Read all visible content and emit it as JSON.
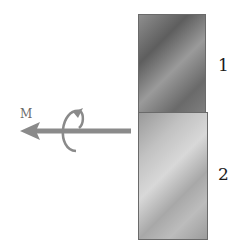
{
  "diagram": {
    "blocks": [
      {
        "id": "1",
        "label": "1",
        "shade": "dark"
      },
      {
        "id": "2",
        "label": "2",
        "shade": "light"
      }
    ],
    "arrow": {
      "label": "M",
      "direction": "left",
      "color": "#8a8a8a",
      "rotation_indicator": "curled-arrow"
    }
  }
}
